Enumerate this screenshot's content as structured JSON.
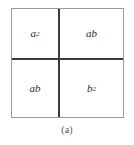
{
  "figure": {
    "caption": "(a)",
    "colors": {
      "background": "#ffffff",
      "outer_border": "#9a9a9a",
      "divider": "#3a3a3a",
      "label_text": "#2b2b2b",
      "caption_text": "#555555"
    },
    "quadrants": [
      {
        "position": "top-left",
        "base": "a",
        "exponent": "2"
      },
      {
        "position": "top-right",
        "base": "ab",
        "exponent": ""
      },
      {
        "position": "bottom-left",
        "base": "ab",
        "exponent": ""
      },
      {
        "position": "bottom-right",
        "base": "b",
        "exponent": "2"
      }
    ]
  }
}
